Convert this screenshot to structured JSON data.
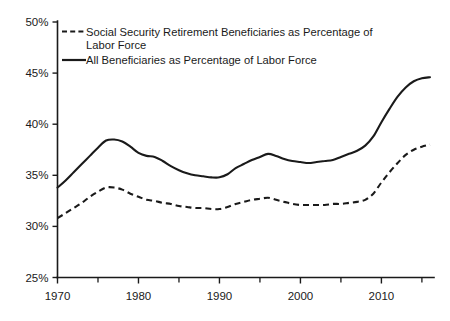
{
  "chart_data": {
    "type": "line",
    "title": "",
    "xlabel": "",
    "ylabel": "",
    "xlim": [
      1970,
      2016
    ],
    "ylim": [
      25,
      50
    ],
    "grid": false,
    "legend_position": "top-left",
    "y_ticks": [
      "25%",
      "30%",
      "35%",
      "40%",
      "45%",
      "50%"
    ],
    "y_tick_values": [
      25,
      30,
      35,
      40,
      45,
      50
    ],
    "x_ticks": [
      "1970",
      "1980",
      "1990",
      "2000",
      "2010"
    ],
    "x_tick_values": [
      1970,
      1980,
      1990,
      2000,
      2010
    ],
    "x_minor_tick_values": [
      1975,
      1985,
      1995,
      2005,
      2015
    ],
    "x": [
      1970,
      1971,
      1972,
      1973,
      1974,
      1975,
      1976,
      1977,
      1978,
      1979,
      1980,
      1981,
      1982,
      1983,
      1984,
      1985,
      1986,
      1987,
      1988,
      1989,
      1990,
      1991,
      1992,
      1993,
      1994,
      1995,
      1996,
      1997,
      1998,
      1999,
      2000,
      2001,
      2002,
      2003,
      2004,
      2005,
      2006,
      2007,
      2008,
      2009,
      2010,
      2011,
      2012,
      2013,
      2014,
      2015,
      2016
    ],
    "series": [
      {
        "name": "All Beneficiaries as Percentage of Labor Force",
        "style": "solid",
        "color": "#1a1a1a",
        "values": [
          33.8,
          34.5,
          35.3,
          36.1,
          36.9,
          37.7,
          38.4,
          38.5,
          38.3,
          37.8,
          37.2,
          36.9,
          36.8,
          36.4,
          35.9,
          35.5,
          35.2,
          35.0,
          34.9,
          34.8,
          34.8,
          35.1,
          35.7,
          36.1,
          36.5,
          36.8,
          37.1,
          36.9,
          36.6,
          36.4,
          36.3,
          36.2,
          36.3,
          36.4,
          36.5,
          36.8,
          37.1,
          37.4,
          37.9,
          38.8,
          40.2,
          41.5,
          42.7,
          43.6,
          44.2,
          44.5,
          44.6
        ]
      },
      {
        "name": "Social Security Retirement Beneficiaries as Percentage of Labor Force",
        "style": "dashed",
        "color": "#1a1a1a",
        "values": [
          30.8,
          31.3,
          31.8,
          32.3,
          32.9,
          33.4,
          33.8,
          33.8,
          33.6,
          33.2,
          32.9,
          32.6,
          32.5,
          32.3,
          32.2,
          32.0,
          31.9,
          31.8,
          31.8,
          31.7,
          31.7,
          31.9,
          32.2,
          32.4,
          32.6,
          32.7,
          32.8,
          32.6,
          32.4,
          32.2,
          32.1,
          32.1,
          32.1,
          32.1,
          32.2,
          32.2,
          32.3,
          32.4,
          32.6,
          33.2,
          34.3,
          35.3,
          36.2,
          37.0,
          37.5,
          37.8,
          38.0
        ]
      }
    ]
  },
  "legend": {
    "items": [
      {
        "label_line1": "Social Security Retirement Beneficiaries as Percentage of",
        "label_line2": "Labor Force",
        "style": "dashed"
      },
      {
        "label_line1": "All Beneficiaries as Percentage of Labor Force",
        "label_line2": "",
        "style": "solid"
      }
    ]
  }
}
